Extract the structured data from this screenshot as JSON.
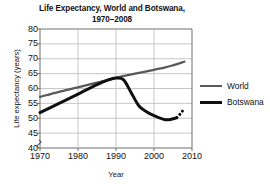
{
  "chart_data": {
    "type": "line",
    "title": "Life Expectancy, World and Botswana,\n1970–2008",
    "xlabel": "Year",
    "ylabel": "Life expectancy (years)",
    "xlim": [
      1970,
      2010
    ],
    "ylim": [
      40,
      80
    ],
    "grid": true,
    "y_axis_break": true,
    "legend_position": "right",
    "x_ticks": [
      1970,
      1980,
      1990,
      2000,
      2010
    ],
    "y_ticks": [
      40,
      45,
      50,
      55,
      60,
      65,
      70,
      75,
      80
    ],
    "series": [
      {
        "name": "World",
        "color": "#595959",
        "style": "solid",
        "x": [
          1970,
          1975,
          1980,
          1985,
          1990,
          1995,
          2000,
          2003,
          2005,
          2008
        ],
        "values": [
          57.2,
          58.9,
          60.4,
          62.0,
          63.6,
          65.0,
          66.3,
          67.1,
          67.8,
          69.0
        ]
      },
      {
        "name": "Botswana",
        "color": "#101010",
        "style": "solid",
        "x": [
          1970,
          1975,
          1980,
          1985,
          1988,
          1990,
          1992,
          1994,
          1996,
          1998,
          2000,
          2003,
          2005,
          2006
        ],
        "values": [
          51.9,
          55.0,
          58.1,
          61.3,
          62.9,
          63.5,
          62.9,
          58.6,
          54.2,
          52.2,
          50.9,
          49.5,
          49.8,
          50.2
        ]
      },
      {
        "name": "Botswana projected",
        "color": "#101010",
        "style": "dotted",
        "x": [
          2006,
          2007,
          2008
        ],
        "values": [
          50.2,
          51.6,
          53.3
        ]
      }
    ]
  },
  "legend": {
    "entries": [
      {
        "label": "World",
        "color": "#595959",
        "thickness": 2.4
      },
      {
        "label": "Botswana",
        "color": "#101010",
        "thickness": 3.1
      }
    ]
  }
}
